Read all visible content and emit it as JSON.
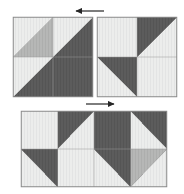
{
  "diagram": {
    "canvas": {
      "width": 184,
      "height": 194
    },
    "background_color": "#ffffff"
  },
  "palette": {
    "light": "#eceded",
    "light_alt": "#e6e7e7",
    "medium": "#b3b4b3",
    "dark": "#595959",
    "outline": "#8a8a8a",
    "seam": "#9a9a9a",
    "arrow": "#262626"
  },
  "blocks": [
    {
      "id": "block-a",
      "name": "left-quilt-block",
      "label": "Block A",
      "x": 13,
      "y": 17,
      "width": 80,
      "height": 80,
      "units": [
        {
          "name": "unit-a-top-left",
          "row": 0,
          "col": 0,
          "kind": "half-square-triangle",
          "diagonal": "tl-br",
          "upper_fill": "light",
          "lower_fill": "medium"
        },
        {
          "name": "unit-a-top-right",
          "row": 0,
          "col": 1,
          "kind": "half-square-triangle",
          "diagonal": "tl-br",
          "upper_fill": "light",
          "lower_fill": "dark"
        },
        {
          "name": "unit-a-bottom-left",
          "row": 1,
          "col": 0,
          "kind": "half-square-triangle",
          "diagonal": "tl-br",
          "upper_fill": "light",
          "lower_fill": "dark"
        },
        {
          "name": "unit-a-bottom-right",
          "row": 1,
          "col": 1,
          "kind": "solid",
          "diagonal": "none",
          "upper_fill": "dark",
          "lower_fill": "dark"
        }
      ]
    },
    {
      "id": "block-b",
      "name": "right-quilt-block",
      "label": "Block B",
      "x": 97,
      "y": 17,
      "width": 80,
      "height": 80,
      "units": [
        {
          "name": "unit-b-top-left",
          "row": 0,
          "col": 0,
          "kind": "solid",
          "diagonal": "none",
          "upper_fill": "light",
          "lower_fill": "light"
        },
        {
          "name": "unit-b-top-right",
          "row": 0,
          "col": 1,
          "kind": "half-square-triangle",
          "diagonal": "tl-br",
          "upper_fill": "dark",
          "lower_fill": "light"
        },
        {
          "name": "unit-b-bottom-left",
          "row": 1,
          "col": 0,
          "kind": "half-square-triangle",
          "diagonal": "tr-bl",
          "upper_fill": "dark",
          "lower_fill": "light"
        },
        {
          "name": "unit-b-bottom-right",
          "row": 1,
          "col": 1,
          "kind": "solid",
          "diagonal": "none",
          "upper_fill": "light",
          "lower_fill": "light"
        }
      ]
    },
    {
      "id": "block-c",
      "name": "joined-quilt-block",
      "label": "Joined unit",
      "x": 21,
      "y": 111,
      "width": 146,
      "height": 76,
      "units": [
        {
          "name": "unit-c-top-left",
          "row": 0,
          "col": 0,
          "kind": "solid",
          "diagonal": "none",
          "upper_fill": "light",
          "lower_fill": "light"
        },
        {
          "name": "unit-c-top-midleft",
          "row": 0,
          "col": 1,
          "kind": "half-square-triangle",
          "diagonal": "tl-br",
          "upper_fill": "dark",
          "lower_fill": "light"
        },
        {
          "name": "unit-c-top-midright",
          "row": 0,
          "col": 2,
          "kind": "solid",
          "diagonal": "none",
          "upper_fill": "dark",
          "lower_fill": "dark"
        },
        {
          "name": "unit-c-top-right",
          "row": 0,
          "col": 3,
          "kind": "half-square-triangle",
          "diagonal": "tr-bl",
          "upper_fill": "dark",
          "lower_fill": "light"
        },
        {
          "name": "unit-c-bottom-left",
          "row": 1,
          "col": 0,
          "kind": "half-square-triangle",
          "diagonal": "tr-bl",
          "upper_fill": "dark",
          "lower_fill": "light"
        },
        {
          "name": "unit-c-bottom-midleft",
          "row": 1,
          "col": 1,
          "kind": "solid",
          "diagonal": "none",
          "upper_fill": "light",
          "lower_fill": "light"
        },
        {
          "name": "unit-c-bottom-midright",
          "row": 1,
          "col": 2,
          "kind": "half-square-triangle",
          "diagonal": "tr-bl",
          "upper_fill": "dark",
          "lower_fill": "light"
        },
        {
          "name": "unit-c-bottom-right",
          "row": 1,
          "col": 3,
          "kind": "half-square-triangle",
          "diagonal": "tl-br",
          "upper_fill": "medium",
          "lower_fill": "light"
        }
      ]
    }
  ],
  "arrows": [
    {
      "id": "arrow-top",
      "name": "arrow-left",
      "direction": "left",
      "x1": 104,
      "y1": 11,
      "x2": 76,
      "y2": 11
    },
    {
      "id": "arrow-middle",
      "name": "arrow-right",
      "direction": "right",
      "x1": 86,
      "y1": 104,
      "x2": 114,
      "y2": 104
    }
  ]
}
